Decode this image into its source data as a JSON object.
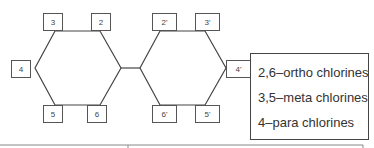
{
  "diagram": {
    "type": "biphenyl-substitution-positions",
    "ring_a_positions": [
      {
        "label": "3",
        "x": 43,
        "y": 13,
        "w": 20,
        "h": 18
      },
      {
        "label": "2",
        "x": 91,
        "y": 13,
        "w": 20,
        "h": 18
      },
      {
        "label": "4",
        "x": 11,
        "y": 60,
        "w": 20,
        "h": 18
      },
      {
        "label": "5",
        "x": 43,
        "y": 105,
        "w": 20,
        "h": 18
      },
      {
        "label": "6",
        "x": 87,
        "y": 105,
        "w": 20,
        "h": 18
      }
    ],
    "ring_b_positions": [
      {
        "label": "2'",
        "x": 152,
        "y": 13,
        "w": 25,
        "h": 18
      },
      {
        "label": "3'",
        "x": 195,
        "y": 13,
        "w": 25,
        "h": 18
      },
      {
        "label": "4'",
        "x": 226,
        "y": 60,
        "w": 25,
        "h": 18
      },
      {
        "label": "6'",
        "x": 152,
        "y": 105,
        "w": 25,
        "h": 18
      },
      {
        "label": "5'",
        "x": 195,
        "y": 105,
        "w": 25,
        "h": 18
      }
    ],
    "legend": [
      "2,6–ortho chlorines",
      "3,5–meta chlorines",
      "4–para chlorines"
    ],
    "colors": {
      "line": "#444444",
      "box_border": "#555555",
      "text": "#333333"
    }
  }
}
